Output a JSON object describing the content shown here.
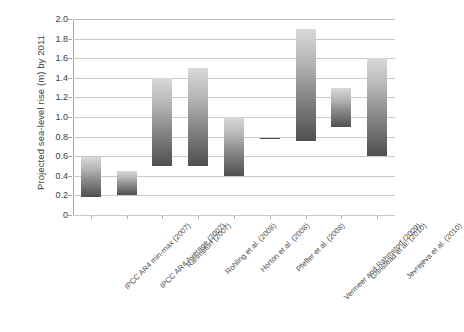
{
  "chart_data": {
    "type": "bar",
    "bar_style": "floating-range",
    "title": "",
    "subtitle": "",
    "xlabel": "",
    "ylabel": "Projected sea-level rise (m) by 2011",
    "ylim": [
      0,
      2.0
    ],
    "ytick_step": 0.2,
    "ytick_labels": [
      "0",
      "0.2",
      "0.4",
      "0.6",
      "0.8",
      "1.0",
      "1.2",
      "1.4",
      "1.6",
      "1.8",
      "2.0"
    ],
    "ytick_values": [
      0,
      0.2,
      0.4,
      0.6,
      0.8,
      1.0,
      1.2,
      1.4,
      1.6,
      1.8,
      2.0
    ],
    "grid": true,
    "grid_axis": "y",
    "legend": false,
    "legend_position": "none",
    "categories": [
      "IPCC AR4 min-max (2007)",
      "IPCC AR4 Average (2007)",
      "Rahmstorf (2007)",
      "Rohling et al. (2008)",
      "Horton et al. (2008)",
      "Pfeffer et al. (2008)",
      "Vermeer and Rahmstorf (2009)",
      "Grinstead et al. (2010)",
      "Jevrejeva et al. (2010)"
    ],
    "series": [
      {
        "name": "low",
        "values": [
          0.18,
          0.2,
          0.5,
          0.5,
          0.4,
          0.785,
          0.75,
          0.9,
          0.6
        ]
      },
      {
        "name": "high",
        "values": [
          0.59,
          0.45,
          1.4,
          1.5,
          1.0,
          0.79,
          1.9,
          1.3,
          1.6
        ]
      }
    ],
    "bar_fill": "vertical gradient light-gray (top) to dark-gray (bottom)",
    "colors": {
      "bar_top": "#d9d9d9",
      "bar_bottom": "#4f4f4f",
      "gridline": "#c9c9c9",
      "axis": "#a8a8a8",
      "text": "#3d3d3d",
      "background": "#ffffff"
    }
  }
}
